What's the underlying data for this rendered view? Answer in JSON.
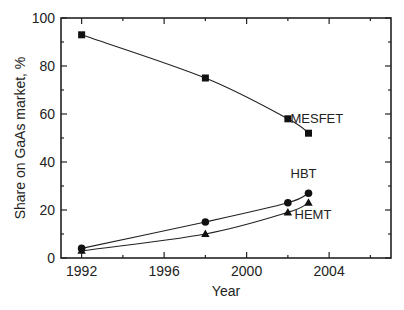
{
  "chart_data": {
    "type": "line",
    "title": "",
    "xlabel": "Year",
    "ylabel": "Share on GaAs market, %",
    "xlim": [
      1991,
      2007
    ],
    "ylim": [
      0,
      100
    ],
    "x_ticks": [
      1992,
      1996,
      2000,
      2004
    ],
    "x_minor_ticks": [
      1994,
      1998,
      2002,
      2006
    ],
    "y_ticks": [
      0,
      20,
      40,
      60,
      80,
      100
    ],
    "y_minor_ticks": [
      10,
      30,
      50,
      70,
      90
    ],
    "grid": false,
    "legend": "inline labels near series ends",
    "series": [
      {
        "name": "MESFET",
        "marker": "square",
        "x": [
          1992,
          1998,
          2002,
          2003
        ],
        "values": [
          93,
          75,
          58,
          52
        ]
      },
      {
        "name": "HBT",
        "marker": "circle",
        "x": [
          1992,
          1998,
          2002,
          2003
        ],
        "values": [
          4,
          15,
          23,
          27
        ]
      },
      {
        "name": "HEMT",
        "marker": "triangle",
        "x": [
          1992,
          1998,
          2002,
          2003
        ],
        "values": [
          3,
          10,
          19,
          23
        ]
      }
    ]
  }
}
